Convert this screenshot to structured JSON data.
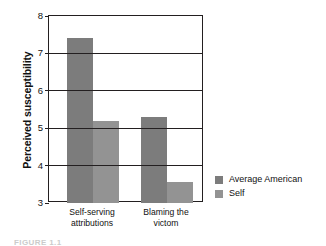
{
  "chart_data": {
    "type": "bar",
    "title": "",
    "subtitle": "",
    "xlabel": "",
    "ylabel": "Perceived susceptibility",
    "categories": [
      "Self-serving attributions",
      "Blaming the victom"
    ],
    "category_lines": [
      [
        "Self-serving",
        "attributions"
      ],
      [
        "Blaming the",
        "victom"
      ]
    ],
    "series": [
      {
        "name": "Average American",
        "color": "#7c7c7c",
        "values": [
          7.4,
          5.3
        ]
      },
      {
        "name": "Self",
        "color": "#939393",
        "values": [
          5.2,
          3.55
        ]
      }
    ],
    "ylim": [
      3,
      8
    ],
    "yticks": [
      3,
      4,
      5,
      6,
      7,
      8
    ],
    "ytick_labels": [
      "3",
      "4",
      "5",
      "6",
      "7",
      "8"
    ],
    "grid": true,
    "grid_axis": "y",
    "legend_position": "right",
    "frame": true
  },
  "legend": {
    "entries": [
      {
        "label": "Average American",
        "color": "#7c7c7c"
      },
      {
        "label": "Self",
        "color": "#939393"
      }
    ]
  },
  "caption": {
    "partial_text": "FIGURE 1.1"
  }
}
